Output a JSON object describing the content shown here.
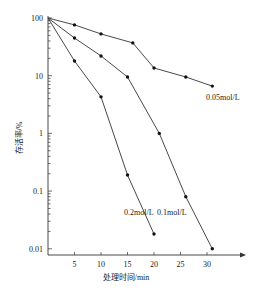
{
  "chart_data": {
    "type": "line",
    "title": "",
    "xlabel": "处理时间/min",
    "ylabel": "存活率/%",
    "yscale": "log",
    "ylim": [
      0.01,
      100
    ],
    "xlim": [
      0,
      35
    ],
    "x_ticks": [
      "5",
      "10",
      "15",
      "20",
      "25",
      "30"
    ],
    "y_ticks": [
      "100",
      "10",
      "1",
      "0.1",
      "0.01"
    ],
    "grid": false,
    "legend": "inline labels at line ends",
    "series": [
      {
        "name": "0.05mol/L",
        "x": [
          0,
          5,
          10,
          16,
          20,
          26,
          31
        ],
        "values": [
          100,
          76,
          53,
          37,
          13.6,
          9.5,
          6.6
        ]
      },
      {
        "name": "0.1mol/L",
        "x": [
          0,
          5,
          10,
          15,
          21,
          26,
          31
        ],
        "values": [
          100,
          45,
          22,
          9.5,
          1.0,
          0.08,
          0.01
        ]
      },
      {
        "name": "0.2mol/L",
        "x": [
          0,
          5,
          10,
          15,
          20
        ],
        "values": [
          100,
          18,
          4.3,
          0.19,
          0.018
        ]
      }
    ]
  }
}
